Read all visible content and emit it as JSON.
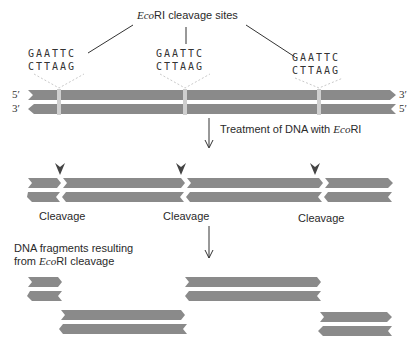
{
  "title": {
    "prefix": "Eco",
    "suffix": "RI cleavage sites"
  },
  "sites": [
    {
      "top": "GAATTC",
      "bottom": "CTTAAG"
    },
    {
      "top": "GAATTC",
      "bottom": "CTTAAG"
    },
    {
      "top": "GAATTC",
      "bottom": "CTTAAG"
    }
  ],
  "strand_ends": {
    "top_left": "5′",
    "top_right": "3′",
    "bottom_left": "3′",
    "bottom_right": "5′"
  },
  "step1": {
    "prefix": "Treatment of DNA with ",
    "enzyme": "Eco",
    "suffix": "RI"
  },
  "cleavage_labels": [
    "Cleavage",
    "Cleavage",
    "Cleavage"
  ],
  "result": {
    "line1": "DNA fragments resulting",
    "line2_prefix": "from ",
    "line2_enzyme": "Eco",
    "line2_suffix": "RI cleavage"
  },
  "colors": {
    "strand": "#8a8a8a",
    "site": "#cfcfcf",
    "text": "#2a2a2a",
    "arrow": "#333333"
  }
}
